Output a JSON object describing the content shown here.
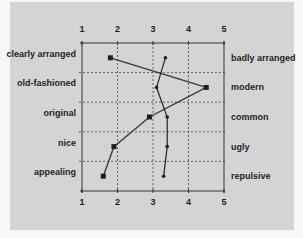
{
  "chart_data": {
    "type": "line",
    "title": "",
    "xlabel": "",
    "ylabel": "",
    "xlim": [
      1,
      5
    ],
    "x_ticks": [
      "1",
      "2",
      "3",
      "4",
      "5"
    ],
    "grid": true,
    "orientation": "horizontal-profile",
    "left_labels": [
      "clearly arranged",
      "old-fashioned",
      "original",
      "nice",
      "appealing"
    ],
    "right_labels": [
      "badly arranged",
      "modern",
      "common",
      "ugly",
      "repulsive"
    ],
    "series": [
      {
        "name": "series-square-markers",
        "marker": "square",
        "values": [
          1.8,
          4.5,
          2.9,
          1.9,
          1.6
        ]
      },
      {
        "name": "series-dot-markers",
        "marker": "dot",
        "values": [
          3.35,
          3.1,
          3.4,
          3.4,
          3.3
        ]
      }
    ],
    "legend": null
  }
}
